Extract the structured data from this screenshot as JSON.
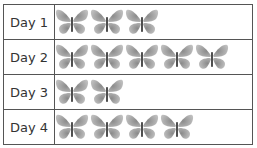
{
  "chart_data": {
    "type": "table",
    "subtype": "pictograph",
    "icon": "butterfly-icon",
    "categories": [
      "Day 1",
      "Day 2",
      "Day 3",
      "Day 4"
    ],
    "values": [
      3,
      5,
      2,
      4
    ],
    "rows": [
      {
        "label": "Day 1",
        "count": 3
      },
      {
        "label": "Day 2",
        "count": 5
      },
      {
        "label": "Day 3",
        "count": 2
      },
      {
        "label": "Day 4",
        "count": 4
      }
    ]
  }
}
